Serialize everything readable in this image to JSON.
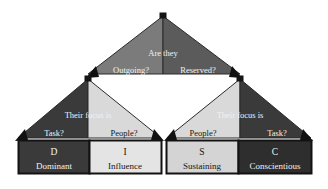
{
  "diagram": {
    "type": "decision-tree",
    "colors": {
      "background": "#ffffff",
      "top_left_fill": "#7b7b7b",
      "top_right_fill": "#5b5b5b",
      "dark_fill": "#3a3a3a",
      "light_fill": "#d9d9d9",
      "outline": "#1a1a1a",
      "text_on_dark": "#f2f2f2",
      "text_on_light": "#151515"
    },
    "root": {
      "question": "Are they",
      "left_option": "Outgoing?",
      "right_option": "Reserved?"
    },
    "branches": [
      {
        "id": "outgoing",
        "question": "Their focus is",
        "left_option": "Task?",
        "right_option": "People?",
        "left_shade": "dark",
        "right_shade": "light"
      },
      {
        "id": "reserved",
        "question": "Their focus is",
        "left_option": "People?",
        "right_option": "Task?",
        "left_shade": "light",
        "right_shade": "dark"
      }
    ],
    "outcomes": [
      {
        "letter": "D",
        "word": "Dominant",
        "shade": "dark"
      },
      {
        "letter": "I",
        "word": "Influence",
        "shade": "light"
      },
      {
        "letter": "S",
        "word": "Sustaining",
        "shade": "light"
      },
      {
        "letter": "C",
        "word": "Conscientious",
        "shade": "dark"
      }
    ]
  }
}
